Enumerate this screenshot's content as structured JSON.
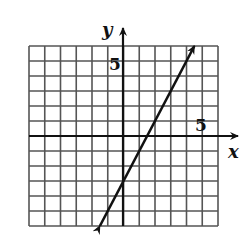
{
  "chart_data": {
    "type": "line",
    "title": "",
    "xlabel": "x",
    "ylabel": "y",
    "xlim": [
      -6,
      6
    ],
    "ylim": [
      -6,
      6
    ],
    "grid": true,
    "grid_step": 1,
    "tick_labels": {
      "x": "5",
      "y": "5"
    },
    "series": [
      {
        "name": "line",
        "equation": "y = 2x - 3",
        "x": [
          -1.5,
          4.5
        ],
        "y": [
          -6,
          6
        ],
        "arrows": "both"
      }
    ]
  },
  "labels": {
    "x_axis": "x",
    "y_axis": "y",
    "x_tick": "5",
    "y_tick": "5"
  },
  "colors": {
    "grid": "#555555",
    "axis": "#111111",
    "line": "#111111",
    "background": "#ffffff"
  }
}
